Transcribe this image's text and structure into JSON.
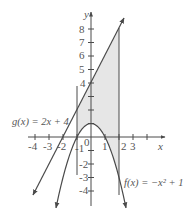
{
  "chart_data": {
    "type": "line",
    "title": "",
    "xlabel": "x",
    "ylabel": "y",
    "xlim": [
      -4.3,
      5.2
    ],
    "ylim": [
      -5.0,
      9.0
    ],
    "grid": false,
    "x_ticks": [
      -4,
      -3,
      -2,
      -1,
      0,
      1,
      2,
      3,
      4
    ],
    "x_tick_labels": [
      "-4",
      "-3",
      "-2",
      "-1",
      "0",
      "1",
      "2",
      "3",
      ""
    ],
    "y_ticks": [
      -4,
      -3,
      -2,
      -1,
      1,
      2,
      3,
      4,
      5,
      6,
      7,
      8
    ],
    "y_tick_labels": [
      "-4",
      "-3",
      "-2",
      "-1",
      "",
      "",
      "",
      "4",
      "5",
      "6",
      "7",
      "8"
    ],
    "series": [
      {
        "name": "g(x) = 2x + 4",
        "expression": "2x + 4",
        "kind": "line",
        "x_range": [
          -4.14,
          2.36
        ]
      },
      {
        "name": "f(x) = -x² + 1",
        "expression": "-x^2 + 1",
        "kind": "parabola",
        "x_range": [
          -2.5,
          2.5
        ]
      }
    ],
    "vertical_lines": [
      {
        "x": -1,
        "y_range": [
          -2.8,
          3.8
        ]
      },
      {
        "x": 2,
        "y_range": [
          -4.3,
          8.1
        ]
      }
    ],
    "shaded_region": {
      "between": [
        "g(x)",
        "f(x)"
      ],
      "x_range": [
        -1,
        2
      ],
      "color": "#e6e6e6"
    },
    "annotations": [
      {
        "text": "g(x) = 2x + 4",
        "position": "left of line near y=1"
      },
      {
        "text": "f(x) = -x² + 1",
        "position": "lower right near x=2"
      }
    ]
  },
  "labels": {
    "y_axis": "y",
    "x_axis": "x",
    "g_label": "g(x) = 2x + 4",
    "f_label": "f(x) = −x² + 1",
    "origin": "0",
    "xt": [
      "-4",
      "-3",
      "-2",
      "-1",
      "1",
      "2",
      "3"
    ],
    "yt": [
      "8",
      "7",
      "6",
      "5",
      "4",
      "-1",
      "-2",
      "-3",
      "-4"
    ]
  },
  "colors": {
    "ink": "#4a4a4a",
    "shade": "#e6e6e6"
  }
}
